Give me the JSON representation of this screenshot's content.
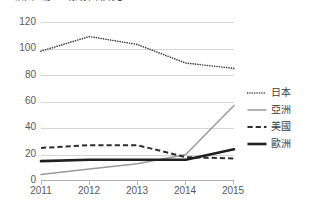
{
  "title": {
    "text": "亞洲市場區域銷售佔比",
    "clipped": true
  },
  "legend": {
    "position": "right",
    "entries": [
      {
        "label": "日本",
        "style": "dotted",
        "color": "#3c3c3c",
        "width": 1.6
      },
      {
        "label": "亞洲",
        "style": "solid-thin",
        "color": "#9a9a9a",
        "width": 1.5
      },
      {
        "label": "美國",
        "style": "dashed",
        "color": "#2e2e2e",
        "width": 2.0
      },
      {
        "label": "歐洲",
        "style": "solid-thick",
        "color": "#1f1f1f",
        "width": 2.6
      }
    ]
  },
  "axes": {
    "y_ticks": [
      "120",
      "100",
      "80",
      "60",
      "40",
      "20",
      "0"
    ],
    "x_ticks": [
      "2011",
      "2012",
      "2013",
      "2014",
      "2015"
    ],
    "grid": true
  },
  "colors": {
    "grid": "#d6d6d6",
    "axis": "#b0b0b0",
    "text": "#595959",
    "japan": "#3c3c3c",
    "asia": "#9a9a9a",
    "usa": "#2e2e2e",
    "europe": "#1f1f1f"
  },
  "chart_data": {
    "type": "line",
    "title": "亞洲市場區域銷售佔比",
    "xlabel": "",
    "ylabel": "",
    "x": [
      "2011",
      "2012",
      "2013",
      "2014",
      "2015"
    ],
    "ylim": [
      0,
      120
    ],
    "yticks": [
      0,
      20,
      40,
      60,
      80,
      100,
      120
    ],
    "grid": true,
    "legend_position": "right",
    "series": [
      {
        "name": "日本",
        "style": "dotted",
        "values": [
          98,
          109,
          103,
          89,
          85
        ]
      },
      {
        "name": "亞洲",
        "style": "solid-thin",
        "values": [
          5,
          9,
          13,
          20,
          57
        ]
      },
      {
        "name": "美國",
        "style": "dashed",
        "values": [
          25,
          27,
          27,
          18,
          17
        ]
      },
      {
        "name": "歐洲",
        "style": "solid-thick",
        "values": [
          15,
          16,
          16,
          16,
          24
        ]
      }
    ]
  }
}
